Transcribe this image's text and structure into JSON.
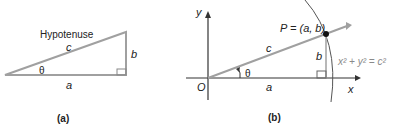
{
  "figure_a": {
    "hypotenuse_label": "Hypotenuse",
    "side_c": "c",
    "side_b": "b",
    "side_a": "a",
    "angle": "θ",
    "caption": "(a)"
  },
  "figure_b": {
    "y_axis": "y",
    "x_axis": "x",
    "origin": "O",
    "point_label": "P = (a, b)",
    "side_c": "c",
    "side_b": "b",
    "side_a": "a",
    "angle": "θ",
    "circle_equation": "x² + y² = c²",
    "caption": "(b)"
  },
  "colors": {
    "line_gray": "#9a9a9a",
    "dark": "#333333",
    "eq_gray": "#8a8a8a"
  }
}
